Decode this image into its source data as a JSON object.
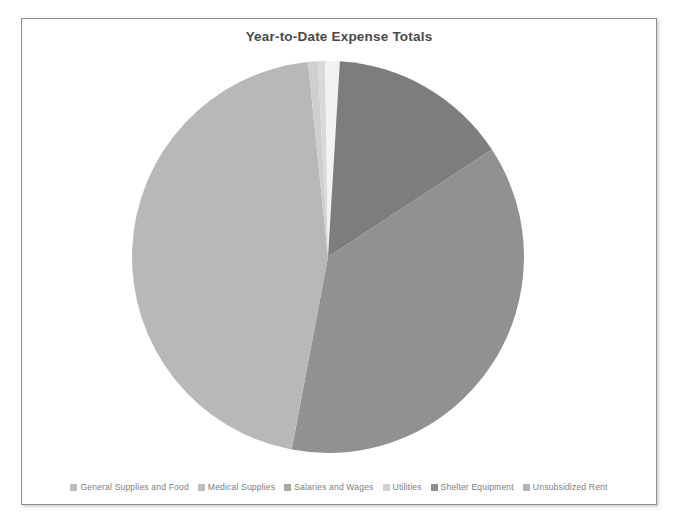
{
  "chart_data": {
    "type": "pie",
    "title": "Year-to-Date Expense Totals",
    "categories": [
      "General Supplies and Food",
      "Medical Supplies",
      "Salaries and Wages",
      "Utilities",
      "Shelter Equipment",
      "Unsubsidized Rent"
    ],
    "values": [
      0.6,
      1.2,
      14.8,
      37.2,
      45.4,
      0.8
    ],
    "unit": "percent",
    "legend_position": "bottom",
    "grid": false,
    "slice_colors": [
      "#d9d9d9",
      "#f2f2f2",
      "#7d7d7d",
      "#919191",
      "#b8b8b8",
      "#cfcfcf"
    ],
    "start_angle_deg": -3,
    "direction": "clockwise"
  },
  "chart": {
    "title": "Year-to-Date Expense Totals"
  },
  "legend": {
    "items": [
      {
        "label": "General Supplies and Food",
        "color": "#bdbdbd"
      },
      {
        "label": "Medical Supplies",
        "color": "#bdbdbd"
      },
      {
        "label": "Salaries and Wages",
        "color": "#a8a8a8"
      },
      {
        "label": "Utilities",
        "color": "#d2d2d2"
      },
      {
        "label": "Shelter Equipment",
        "color": "#8f8f8f"
      },
      {
        "label": "Unsubsidized Rent",
        "color": "#b5b5b5"
      }
    ]
  },
  "colors": {
    "frame_border": "#8e8e8e",
    "title_text": "#4a4a4a",
    "legend_text": "#7e7e7e",
    "background": "#ffffff"
  }
}
